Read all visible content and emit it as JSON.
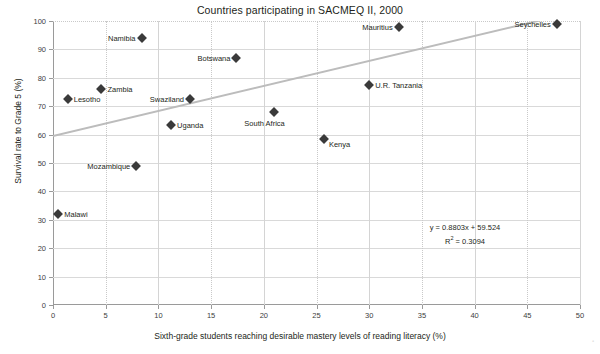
{
  "chart_data": {
    "type": "scatter",
    "title": "Countries participating in SACMEQ II, 2000",
    "xlabel": "Sixth-grade students reaching desirable mastery levels of reading literacy (%)",
    "ylabel": "Survival rate to Grade 5 (%)",
    "xlim": [
      0,
      50
    ],
    "ylim": [
      0,
      100
    ],
    "xticks": [
      0,
      5,
      10,
      15,
      20,
      25,
      30,
      35,
      40,
      45,
      50
    ],
    "yticks": [
      0,
      10,
      20,
      30,
      40,
      50,
      60,
      70,
      80,
      90,
      100
    ],
    "grid": true,
    "legend": "none",
    "marker_color": "#3a3a3a",
    "trendline_color": "#bcbcbc",
    "points": [
      {
        "label": "Malawi",
        "x": 0.5,
        "y": 32.0,
        "label_side": "right"
      },
      {
        "label": "Lesotho",
        "x": 1.4,
        "y": 72.5,
        "label_side": "right"
      },
      {
        "label": "Zambia",
        "x": 4.6,
        "y": 76.0,
        "label_side": "right"
      },
      {
        "label": "Mozambique",
        "x": 7.9,
        "y": 49.0,
        "label_side": "left"
      },
      {
        "label": "Namibia",
        "x": 8.4,
        "y": 94.0,
        "label_side": "left"
      },
      {
        "label": "Uganda",
        "x": 11.2,
        "y": 63.5,
        "label_side": "right"
      },
      {
        "label": "Swaziland",
        "x": 13.0,
        "y": 72.5,
        "label_side": "left"
      },
      {
        "label": "Botswana",
        "x": 17.4,
        "y": 87.0,
        "label_side": "left"
      },
      {
        "label": "South Africa",
        "x": 21.0,
        "y": 68.0,
        "label_side": "below"
      },
      {
        "label": "Kenya",
        "x": 25.7,
        "y": 58.5,
        "label_side": "right-below"
      },
      {
        "label": "U.R. Tanzania",
        "x": 30.0,
        "y": 77.5,
        "label_side": "right"
      },
      {
        "label": "Mauritius",
        "x": 32.8,
        "y": 98.0,
        "label_side": "left"
      },
      {
        "label": "Seychelles",
        "x": 47.8,
        "y": 99.0,
        "label_side": "left"
      }
    ],
    "trendline": {
      "slope": 0.8803,
      "intercept": 59.524,
      "r_squared": 0.3094,
      "equation_text": "y = 0.8803x + 59.524",
      "r2_prefix": "R",
      "r2_exponent": "2",
      "r2_text": " = 0.3094"
    }
  }
}
